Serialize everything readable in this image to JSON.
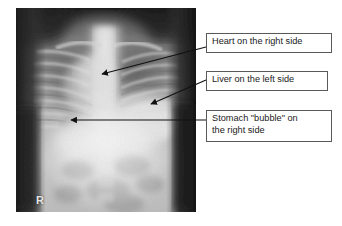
{
  "figure": {
    "type": "annotated-radiograph",
    "modality": "chest-abdomen-x-ray",
    "image_marker": "R",
    "image_marker_meaning": "right-side-marker",
    "background_color": "#ffffff",
    "callout_border_color": "#595959",
    "callout_fill_color": "#ffffff",
    "leader_line_color": "#111111",
    "text_color": "#1a1a1a"
  },
  "annotations": [
    {
      "id": "heart",
      "label": "Heart on the right side",
      "box": {
        "x": 206,
        "y": 33,
        "w": 126,
        "h": 20
      },
      "leader": {
        "x1": 206,
        "y1": 47,
        "x2": 101,
        "y2": 74
      },
      "arrow_target": "heart"
    },
    {
      "id": "liver",
      "label": "Liver on the left side",
      "box": {
        "x": 206,
        "y": 71,
        "w": 122,
        "h": 20
      },
      "leader": {
        "x1": 206,
        "y1": 80,
        "x2": 150,
        "y2": 104
      },
      "arrow_target": "liver"
    },
    {
      "id": "stomach",
      "label": "Stomach \"bubble\" on\nthe right side",
      "box": {
        "x": 206,
        "y": 110,
        "w": 126,
        "h": 32
      },
      "leader": {
        "x1": 206,
        "y1": 120,
        "x2": 70,
        "y2": 120
      },
      "arrow_target": "stomach-bubble"
    }
  ]
}
